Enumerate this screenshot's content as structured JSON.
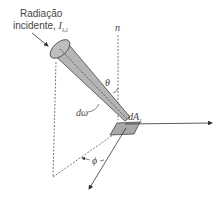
{
  "diagram": {
    "title_line1": "Radiação",
    "title_line2": "incidente,",
    "intensity_symbol": "I",
    "intensity_subscript": "λ,i",
    "normal_label": "n",
    "zenith_angle_label": "θ",
    "solid_angle_label": "dω",
    "area_label": "dA",
    "area_subscript": "1",
    "azimuth_angle_label": "ϕ",
    "colors": {
      "cone_fill": "#b5b5b5",
      "cone_stroke": "#444444",
      "patch_fill": "#a8a8a8",
      "line": "#333333",
      "text": "#444444"
    }
  }
}
